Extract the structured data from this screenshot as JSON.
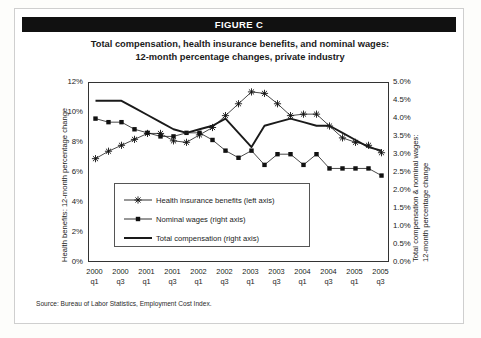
{
  "banner": {
    "label": "FIGURE C"
  },
  "title": {
    "line1": "Total compensation, health insurance benefits, and nominal wages:",
    "line2": "12-month percentage changes, private industry"
  },
  "source": {
    "text": "Source:  Bureau of Labor Statistics, Employment Cost Index."
  },
  "axes": {
    "left_title": "Health benefits: 12-month percentage change",
    "right_title_line1": "Total compensation & nominal wages:",
    "right_title_line2": "12-month percentage change",
    "left_ticks": [
      "12%",
      "10%",
      "8%",
      "6%",
      "4%",
      "2%",
      "0%"
    ],
    "right_ticks": [
      "5.0%",
      "4.5%",
      "4.0%",
      "3.5%",
      "3.0%",
      "2.5%",
      "2.0%",
      "1.5%",
      "1.0%",
      "0.5%",
      "0.0%"
    ]
  },
  "legend": {
    "position": "inside-lower-left",
    "items": [
      {
        "label": "Health insurance benefits (left axis)",
        "marker": "star",
        "key": "health-insurance-benefits"
      },
      {
        "label": "Nominal wages (right axis)",
        "marker": "square",
        "key": "nominal-wages"
      },
      {
        "label": "Total compensation (right axis)",
        "marker": "line",
        "key": "total-compensation"
      }
    ]
  },
  "chart_data": {
    "type": "line",
    "title": "Total compensation, health insurance benefits, and nominal wages: 12-month percentage changes, private industry",
    "xlabel": "",
    "ylabel": "Health benefits: 12-month percentage change",
    "y2label": "Total compensation & nominal wages: 12-month percentage change",
    "grid": false,
    "ylim": [
      0,
      12
    ],
    "y2lim": [
      0.0,
      5.0
    ],
    "x": [
      "2000 q1",
      "2000 q2",
      "2000 q3",
      "2000 q4",
      "2001 q1",
      "2001 q2",
      "2001 q3",
      "2001 q4",
      "2002 q1",
      "2002 q2",
      "2002 q3",
      "2002 q4",
      "2003 q1",
      "2003 q2",
      "2003 q3",
      "2003 q4",
      "2004 q1",
      "2004 q2",
      "2004 q3",
      "2004 q4",
      "2005 q1",
      "2005 q2",
      "2005 q3"
    ],
    "x_tick_labels": [
      {
        "year": "2000",
        "quarter": "q1"
      },
      {
        "year": "2000",
        "quarter": "q3"
      },
      {
        "year": "2001",
        "quarter": "q1"
      },
      {
        "year": "2001",
        "quarter": "q3"
      },
      {
        "year": "2002",
        "quarter": "q1"
      },
      {
        "year": "2002",
        "quarter": "q3"
      },
      {
        "year": "2003",
        "quarter": "q1"
      },
      {
        "year": "2003",
        "quarter": "q3"
      },
      {
        "year": "2004",
        "quarter": "q1"
      },
      {
        "year": "2004",
        "quarter": "q3"
      },
      {
        "year": "2005",
        "quarter": "q1"
      },
      {
        "year": "2005",
        "quarter": "q3"
      }
    ],
    "series": [
      {
        "name": "Health insurance benefits (left axis)",
        "axis": "left",
        "unit": "percent",
        "marker": "star",
        "values": [
          6.9,
          7.4,
          7.8,
          8.2,
          8.6,
          8.6,
          8.1,
          8.0,
          8.5,
          9.0,
          9.8,
          10.6,
          11.4,
          11.3,
          10.6,
          9.8,
          9.9,
          9.9,
          9.1,
          8.3,
          8.0,
          7.8,
          7.3
        ]
      },
      {
        "name": "Nominal wages (right axis)",
        "axis": "right",
        "unit": "percent",
        "marker": "square",
        "values": [
          4.0,
          3.9,
          3.9,
          3.7,
          3.6,
          3.5,
          3.5,
          3.6,
          3.6,
          3.4,
          3.1,
          2.9,
          3.1,
          2.7,
          3.0,
          3.0,
          2.7,
          3.0,
          2.6,
          2.6,
          2.6,
          2.6,
          2.4
        ]
      },
      {
        "name": "Total compensation (right axis)",
        "axis": "right",
        "unit": "percent",
        "marker": "none",
        "values": [
          4.5,
          4.5,
          4.5,
          4.3,
          4.1,
          3.9,
          3.7,
          3.6,
          3.7,
          3.8,
          4.0,
          3.6,
          3.2,
          3.8,
          3.9,
          4.0,
          3.9,
          3.8,
          3.8,
          3.6,
          3.4,
          3.2,
          3.1
        ]
      }
    ]
  }
}
